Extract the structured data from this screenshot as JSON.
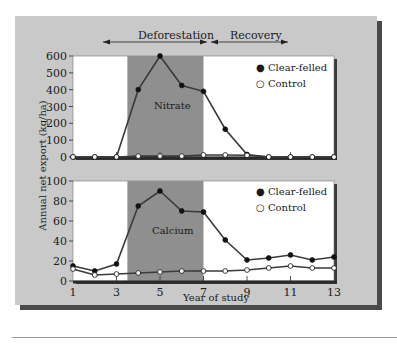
{
  "chart_data": [
    {
      "type": "line",
      "panel": "top",
      "annotation": "Nitrate",
      "x": [
        1,
        2,
        3,
        4,
        5,
        6,
        7,
        8,
        9,
        10,
        11,
        12,
        13
      ],
      "series": [
        {
          "name": "Clear-felled",
          "marker": "filled-circle",
          "values": [
            0,
            0,
            0,
            400,
            600,
            425,
            390,
            165,
            15,
            0,
            0,
            0,
            0
          ]
        },
        {
          "name": "Control",
          "marker": "open-circle",
          "values": [
            0,
            0,
            0,
            5,
            5,
            5,
            12,
            12,
            10,
            0,
            0,
            0,
            0
          ]
        }
      ],
      "ylim": [
        0,
        600
      ],
      "yticks": [
        0,
        100,
        200,
        300,
        400,
        500,
        600
      ],
      "shaded_region": {
        "label": "Deforestation",
        "x_start": 3.5,
        "x_end": 7
      }
    },
    {
      "type": "line",
      "panel": "bottom",
      "annotation": "Calcium",
      "x": [
        1,
        2,
        3,
        4,
        5,
        6,
        7,
        8,
        9,
        10,
        11,
        12,
        13
      ],
      "series": [
        {
          "name": "Clear-felled",
          "marker": "filled-circle",
          "values": [
            15,
            10,
            17,
            75,
            90,
            70,
            69,
            41,
            21,
            23,
            26,
            21,
            24
          ]
        },
        {
          "name": "Control",
          "marker": "open-circle",
          "values": [
            12,
            6,
            7,
            8,
            9,
            10,
            10,
            10,
            11,
            13,
            15,
            13,
            13
          ]
        }
      ],
      "ylim": [
        0,
        100
      ],
      "yticks": [
        0,
        20,
        40,
        60,
        80,
        100
      ],
      "xticks": [
        1,
        3,
        5,
        7,
        9,
        11,
        13
      ],
      "shaded_region": {
        "label": "Deforestation",
        "x_start": 3.5,
        "x_end": 7
      }
    }
  ],
  "labels": {
    "ylabel": "Annual net export (kg/ha)",
    "xlabel": "Year of study",
    "phase_deforestation": "Deforestation",
    "phase_recovery": "Recovery",
    "top_annotation": "Nitrate",
    "bottom_annotation": "Calcium",
    "legend_clear": "Clear-felled",
    "legend_control": "Control"
  },
  "colors": {
    "panel": "#c9c9c9",
    "plot_bg": "#ffffff",
    "shaded": "#8f8f8f",
    "line": "#3a3a3a",
    "axis": "#2a2a2a"
  }
}
